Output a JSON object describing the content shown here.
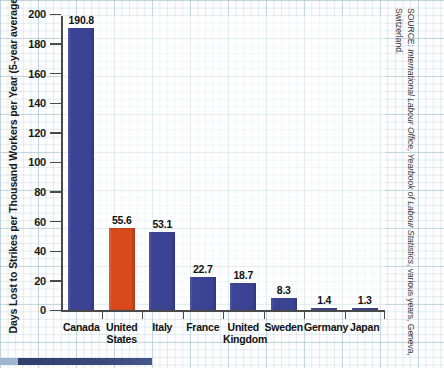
{
  "chart_data": {
    "type": "bar",
    "title": "",
    "xlabel": "",
    "ylabel": "Days Lost to Strikes per Thousand Workers per Year (5-year average)",
    "ylim": [
      0,
      200
    ],
    "yticks": [
      0,
      20,
      40,
      60,
      80,
      100,
      120,
      140,
      160,
      180,
      200
    ],
    "grid": true,
    "legend": "none",
    "categories": [
      "Canada",
      "United States",
      "Italy",
      "France",
      "United Kingdom",
      "Sweden",
      "Germany",
      "Japan"
    ],
    "values": [
      190.8,
      55.6,
      53.1,
      22.7,
      18.7,
      8.3,
      1.4,
      1.3
    ],
    "value_labels": [
      "190.8",
      "55.6",
      "53.1",
      "22.7",
      "18.7",
      "8.3",
      "1.4",
      "1.3"
    ],
    "bar_colors": [
      "#3b4395",
      "#d9491c",
      "#3b4395",
      "#3b4395",
      "#3b4395",
      "#3b4395",
      "#3b4395",
      "#3b4395"
    ],
    "highlighted_category": "United States",
    "source": "SOURCE: International Labour Office, Yearbook of Labour Statistics, various years, Geneva, Switzerland."
  },
  "colors": {
    "bar_default": "#3b4395",
    "bar_accent": "#d9491c",
    "axis": "#4a4a4a",
    "grid": "#a7c3d0",
    "text": "#111111"
  },
  "source_note": {
    "prefix": "SOURCE: ",
    "publisher": "International Labour Office, ",
    "title": "Yearbook of Labour Statistics",
    "tail": ", various years, Geneva, Switzerland."
  }
}
